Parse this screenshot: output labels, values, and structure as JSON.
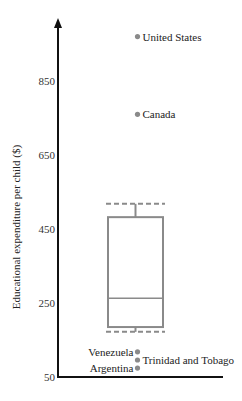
{
  "chart_data": {
    "type": "box",
    "title": "",
    "xlabel": "",
    "ylabel": "Educational expenditure per child ($)",
    "ylim": [
      50,
      1000
    ],
    "yticks": [
      50,
      250,
      450,
      650,
      850
    ],
    "ytick_labels": [
      "50",
      "250",
      "450",
      "650",
      "850"
    ],
    "grid": false,
    "box": {
      "upper_fence": 518,
      "q3": 482,
      "median": 263,
      "q1": 185,
      "lower_fence": 172
    },
    "outliers": [
      {
        "label": "United States",
        "value": 970
      },
      {
        "label": "Canada",
        "value": 760
      },
      {
        "label": "Venezuela",
        "value": 118
      },
      {
        "label": "Trinidad and Tobago",
        "value": 96
      },
      {
        "label": "Argentina",
        "value": 74
      }
    ],
    "colors": {
      "axis": "#111111",
      "box": "#8a8a8a",
      "points": "#8a8a8a"
    }
  }
}
